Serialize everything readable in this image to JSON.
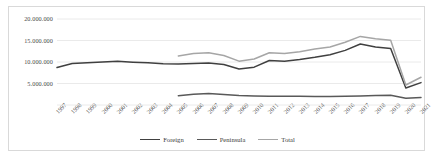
{
  "chart_data": {
    "type": "line",
    "title": "",
    "subtitle": "",
    "xlabel": "",
    "ylabel": "",
    "grid": true,
    "legend_position": "bottom",
    "ylim": [
      0,
      20000000
    ],
    "yticks": [
      5000000,
      10000000,
      15000000,
      20000000
    ],
    "ytick_labels": [
      "5.000.000",
      "10.000.000",
      "15.000.000",
      "20.000.000"
    ],
    "categories": [
      "1997",
      "1998",
      "1999",
      "2000",
      "2001",
      "2002",
      "2003",
      "2004",
      "2005",
      "2006",
      "2007",
      "2008",
      "2009",
      "2010",
      "2011",
      "2012",
      "2013",
      "2014",
      "2015",
      "2016",
      "2017",
      "2018",
      "2019",
      "2020",
      "2021"
    ],
    "series": [
      {
        "name": "Foreign",
        "color": "#404040",
        "values": [
          8700000,
          9650000,
          9850000,
          10000000,
          10150000,
          9950000,
          9800000,
          9600000,
          9550000,
          9650000,
          9750000,
          9400000,
          8350000,
          8800000,
          10350000,
          10200000,
          10600000,
          11100000,
          11700000,
          12700000,
          14200000,
          13500000,
          13150000,
          3950000,
          5200000
        ]
      },
      {
        "name": "Peninsula",
        "color": "#595959",
        "values": [
          null,
          null,
          null,
          null,
          null,
          null,
          null,
          null,
          2150000,
          2500000,
          2700000,
          2450000,
          2200000,
          2100000,
          2050000,
          2050000,
          2020000,
          2000000,
          2000000,
          2050000,
          2100000,
          2200000,
          2250000,
          1550000,
          1750000
        ]
      },
      {
        "name": "Total",
        "color": "#a6a6a6",
        "values": [
          null,
          null,
          null,
          null,
          null,
          null,
          null,
          null,
          11400000,
          11950000,
          12150000,
          11500000,
          10200000,
          10700000,
          12150000,
          12000000,
          12400000,
          13000000,
          13500000,
          14600000,
          15950000,
          15400000,
          15050000,
          4650000,
          6450000
        ]
      }
    ]
  },
  "legend": {
    "items": [
      {
        "label": "Foreign",
        "color": "#404040"
      },
      {
        "label": "Peninsula",
        "color": "#595959"
      },
      {
        "label": "Total",
        "color": "#a6a6a6"
      }
    ]
  },
  "axes": {
    "gridline_color": "#e4e4e4",
    "tick_text_color": "#4a4a4a"
  }
}
